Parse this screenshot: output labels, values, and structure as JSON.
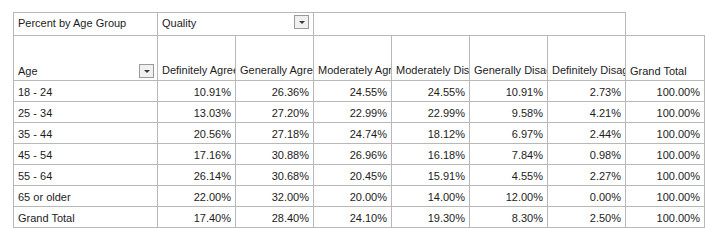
{
  "pivot": {
    "title_label": "Percent by Age Group",
    "filter": {
      "label": "Quality",
      "dropdown_icon": "chevron-down-icon"
    },
    "row_header": {
      "label": "Age",
      "dropdown_icon": "chevron-down-icon"
    },
    "column_headers": [
      "Definitely Agree",
      "Generally Agree",
      "Moderately Agree",
      "Moderately Disagree",
      "Generally Disagree",
      "Definitely Disagree"
    ],
    "grand_total_header": "Grand Total",
    "rows": [
      {
        "label": "18 - 24",
        "values": [
          "10.91%",
          "26.36%",
          "24.55%",
          "24.55%",
          "10.91%",
          "2.73%"
        ],
        "total": "100.00%"
      },
      {
        "label": "25 - 34",
        "values": [
          "13.03%",
          "27.20%",
          "22.99%",
          "22.99%",
          "9.58%",
          "4.21%"
        ],
        "total": "100.00%"
      },
      {
        "label": "35 - 44",
        "values": [
          "20.56%",
          "27.18%",
          "24.74%",
          "18.12%",
          "6.97%",
          "2.44%"
        ],
        "total": "100.00%"
      },
      {
        "label": "45 - 54",
        "values": [
          "17.16%",
          "30.88%",
          "26.96%",
          "16.18%",
          "7.84%",
          "0.98%"
        ],
        "total": "100.00%"
      },
      {
        "label": "55 - 64",
        "values": [
          "26.14%",
          "30.68%",
          "20.45%",
          "15.91%",
          "4.55%",
          "2.27%"
        ],
        "total": "100.00%"
      },
      {
        "label": "65 or older",
        "values": [
          "22.00%",
          "32.00%",
          "20.00%",
          "14.00%",
          "12.00%",
          "0.00%"
        ],
        "total": "100.00%"
      }
    ],
    "grand_total_row": {
      "label": "Grand Total",
      "values": [
        "17.40%",
        "28.40%",
        "24.10%",
        "19.30%",
        "8.30%",
        "2.50%"
      ],
      "total": "100.00%"
    },
    "colors": {
      "grid_line": "#b8b8b8",
      "strong_line": "#6f6f6f",
      "text": "#1c1c1c",
      "background": "#ffffff",
      "button_face": "#f0f0f0"
    }
  },
  "chart_data": {
    "type": "table",
    "title": "Percent by Age Group",
    "xlabel": "Quality",
    "ylabel": "Age",
    "categories": [
      "Definitely Agree",
      "Generally Agree",
      "Moderately Agree",
      "Moderately Disagree",
      "Generally Disagree",
      "Definitely Disagree",
      "Grand Total"
    ],
    "series": [
      {
        "name": "18 - 24",
        "values": [
          10.91,
          26.36,
          24.55,
          24.55,
          10.91,
          2.73,
          100.0
        ]
      },
      {
        "name": "25 - 34",
        "values": [
          13.03,
          27.2,
          22.99,
          22.99,
          9.58,
          4.21,
          100.0
        ]
      },
      {
        "name": "35 - 44",
        "values": [
          20.56,
          27.18,
          24.74,
          18.12,
          6.97,
          2.44,
          100.0
        ]
      },
      {
        "name": "45 - 54",
        "values": [
          17.16,
          30.88,
          26.96,
          16.18,
          7.84,
          0.98,
          100.0
        ]
      },
      {
        "name": "55 - 64",
        "values": [
          26.14,
          30.68,
          20.45,
          15.91,
          4.55,
          2.27,
          100.0
        ]
      },
      {
        "name": "65 or older",
        "values": [
          22.0,
          32.0,
          20.0,
          14.0,
          12.0,
          0.0,
          100.0
        ]
      },
      {
        "name": "Grand Total",
        "values": [
          17.4,
          28.4,
          24.1,
          19.3,
          8.3,
          2.5,
          100.0
        ]
      }
    ],
    "units": "percent",
    "grid": true,
    "legend": "none"
  }
}
